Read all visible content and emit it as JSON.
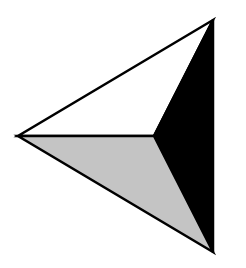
{
  "figure": {
    "width": 246,
    "height": 268,
    "background": "#ffffff",
    "shape": "three-faceted triangular pyramid pointing left",
    "vertices": {
      "top": [
        213,
        20
      ],
      "left": [
        18,
        136
      ],
      "bottom": [
        213,
        252
      ],
      "center": [
        154,
        136
      ]
    },
    "facets": [
      {
        "name": "top-facet",
        "fill": "#ffffff",
        "points": "213,20 18,136 154,136"
      },
      {
        "name": "right-facet",
        "fill": "#000000",
        "points": "213,20 154,136 213,252"
      },
      {
        "name": "bottom-facet",
        "fill": "#c4c4c4",
        "points": "18,136 154,136 213,252"
      }
    ],
    "stroke": {
      "color": "#000000",
      "width": 2.5
    }
  }
}
